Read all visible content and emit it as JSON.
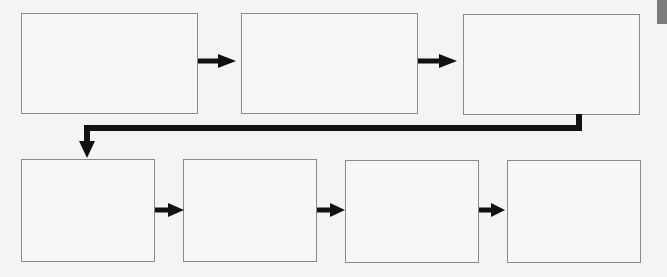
{
  "diagram": {
    "type": "flowchart",
    "colors": {
      "background": "#f4f4f2",
      "box_border": "#8a8a8a",
      "box_fill": "#f7f7f5",
      "arrow": "#111111",
      "side_tab": "#7c7c7c"
    },
    "rows": [
      {
        "name": "top-row",
        "boxes": [
          {
            "id": "step-1",
            "label": ""
          },
          {
            "id": "step-2",
            "label": ""
          },
          {
            "id": "step-3",
            "label": ""
          }
        ]
      },
      {
        "name": "bottom-row",
        "boxes": [
          {
            "id": "step-4",
            "label": ""
          },
          {
            "id": "step-5",
            "label": ""
          },
          {
            "id": "step-6",
            "label": ""
          },
          {
            "id": "step-7",
            "label": ""
          }
        ]
      }
    ],
    "connections": [
      {
        "from": "step-1",
        "to": "step-2",
        "style": "straight-arrow"
      },
      {
        "from": "step-2",
        "to": "step-3",
        "style": "straight-arrow"
      },
      {
        "from": "step-3",
        "to": "step-4",
        "style": "elbow-arrow"
      },
      {
        "from": "step-4",
        "to": "step-5",
        "style": "straight-arrow"
      },
      {
        "from": "step-5",
        "to": "step-6",
        "style": "straight-arrow"
      },
      {
        "from": "step-6",
        "to": "step-7",
        "style": "straight-arrow"
      }
    ]
  }
}
